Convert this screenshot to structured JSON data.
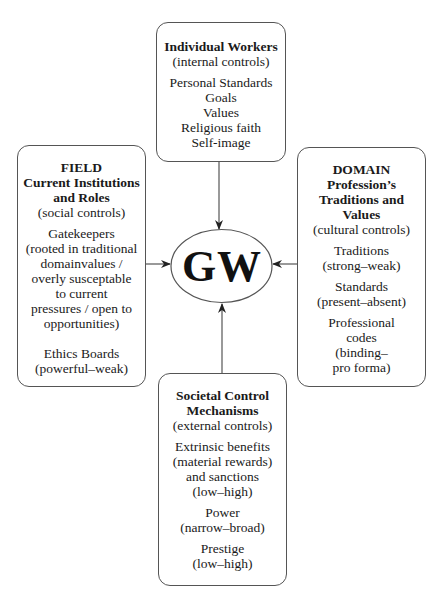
{
  "diagram": {
    "center": {
      "label": "GW"
    },
    "boxes": {
      "top": {
        "title_lines": [
          "Individual Workers"
        ],
        "subtitle": "(internal controls)",
        "groups": [
          [
            "Personal Standards",
            "Goals",
            "Values",
            "Religious faith",
            "Self-image"
          ]
        ]
      },
      "left": {
        "title_lines": [
          "FIELD",
          "Current Institutions",
          "and Roles"
        ],
        "subtitle": "(social controls)",
        "groups": [
          [
            "Gatekeepers",
            "(rooted in traditional",
            "domainvalues /",
            "overly susceptable",
            "to current",
            "pressures / open to",
            "opportunities)"
          ],
          [
            "Ethics Boards",
            "(powerful–weak)"
          ]
        ]
      },
      "right": {
        "title_lines": [
          "DOMAIN",
          "Profession’s",
          "Traditions and",
          "Values"
        ],
        "subtitle": "(cultural controls)",
        "groups": [
          [
            "Traditions",
            "(strong–weak)"
          ],
          [
            "Standards",
            "(present–absent)"
          ],
          [
            "Professional",
            "codes",
            "(binding–",
            "pro forma)"
          ]
        ]
      },
      "bottom": {
        "title_lines": [
          "Societal Control",
          "Mechanisms"
        ],
        "subtitle": "(external controls)",
        "groups": [
          [
            "Extrinsic benefits",
            "(material rewards)",
            "and sanctions",
            "(low–high)"
          ],
          [
            "Power",
            "(narrow–broad)"
          ],
          [
            "Prestige",
            "(low–high)"
          ]
        ]
      }
    },
    "arrows": [
      {
        "from": "top",
        "to": "center"
      },
      {
        "from": "left",
        "to": "center"
      },
      {
        "from": "right",
        "to": "center"
      },
      {
        "from": "bottom",
        "to": "center"
      }
    ],
    "colors": {
      "stroke": "#555555",
      "text": "#1a1a1a",
      "background": "#ffffff"
    }
  }
}
